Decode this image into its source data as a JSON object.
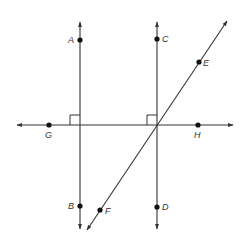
{
  "diagram": {
    "type": "geometry-lines",
    "colors": {
      "line": "#333333",
      "point": "#111111",
      "label": "#333333",
      "background": "#ffffff"
    },
    "lines": [
      {
        "id": "line-AB",
        "name": "Line AB",
        "kind": "vertical",
        "x1": 80,
        "y1": 22,
        "x2": 80,
        "y2": 229,
        "arrows": "both"
      },
      {
        "id": "line-CD",
        "name": "Line CD",
        "kind": "vertical",
        "x1": 157,
        "y1": 22,
        "x2": 157,
        "y2": 229,
        "arrows": "both"
      },
      {
        "id": "line-GH",
        "name": "Line GH",
        "kind": "horizontal",
        "x1": 17,
        "y1": 125,
        "x2": 233,
        "y2": 125,
        "arrows": "both"
      },
      {
        "id": "line-EF",
        "name": "Line EF",
        "kind": "diagonal",
        "x1": 227,
        "y1": 21,
        "x2": 87,
        "y2": 230,
        "arrows": "both"
      }
    ],
    "points": [
      {
        "label": "A",
        "x": 80,
        "y": 40,
        "lx": 68,
        "ly": 43
      },
      {
        "label": "B",
        "x": 80,
        "y": 206,
        "lx": 68,
        "ly": 209
      },
      {
        "label": "C",
        "x": 157,
        "y": 39,
        "lx": 162,
        "ly": 42
      },
      {
        "label": "D",
        "x": 157,
        "y": 207,
        "lx": 162,
        "ly": 210
      },
      {
        "label": "E",
        "x": 199,
        "y": 62,
        "lx": 203,
        "ly": 66
      },
      {
        "label": "F",
        "x": 100,
        "y": 210,
        "lx": 105,
        "ly": 214
      },
      {
        "label": "G",
        "x": 49,
        "y": 125,
        "lx": 45,
        "ly": 138
      },
      {
        "label": "H",
        "x": 198,
        "y": 125,
        "lx": 194,
        "ly": 138
      }
    ],
    "right_angles": [
      {
        "at": "AB ∩ GH",
        "x": 80,
        "y": 125,
        "size": 10,
        "quadrant": "upper-left"
      },
      {
        "at": "CD ∩ GH",
        "x": 157,
        "y": 125,
        "size": 10,
        "quadrant": "upper-left"
      }
    ]
  }
}
